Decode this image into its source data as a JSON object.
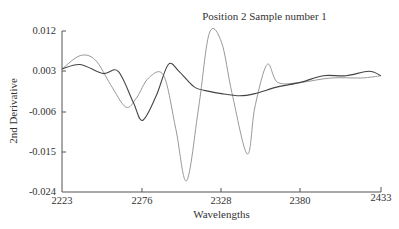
{
  "chart_data": {
    "type": "line",
    "title": "Position 2 Sample number 1",
    "xlabel": "Wavelengths",
    "ylabel": "2nd Derivative",
    "xlim": [
      2223,
      2433
    ],
    "ylim": [
      -0.024,
      0.012
    ],
    "x_ticks": [
      "2223",
      "2276",
      "2328",
      "2380",
      "2433"
    ],
    "y_ticks": [
      "0.012",
      "0.003",
      "-0.006",
      "-0.015",
      "-0.024"
    ],
    "grid": false,
    "legend": null,
    "series": [
      {
        "name": "dark",
        "color": "#444444",
        "x": [
          2223,
          2235,
          2250,
          2260,
          2270,
          2276,
          2285,
          2293,
          2300,
          2310,
          2320,
          2328,
          2340,
          2350,
          2365,
          2380,
          2395,
          2410,
          2425,
          2433
        ],
        "y": [
          0.0035,
          0.0045,
          0.0025,
          0.003,
          -0.004,
          -0.008,
          -0.0025,
          0.0045,
          0.003,
          -0.0005,
          -0.0015,
          -0.002,
          -0.0025,
          -0.002,
          -0.0005,
          0.0005,
          0.002,
          0.002,
          0.003,
          0.002
        ]
      },
      {
        "name": "light",
        "color": "#999999",
        "x": [
          2223,
          2235,
          2245,
          2255,
          2265,
          2272,
          2280,
          2290,
          2298,
          2305,
          2313,
          2320,
          2328,
          2335,
          2345,
          2350,
          2358,
          2365,
          2380,
          2400,
          2420,
          2433
        ],
        "y": [
          0.0035,
          0.0065,
          0.0055,
          0.0,
          -0.005,
          -0.003,
          0.0015,
          0.002,
          -0.01,
          -0.0215,
          -0.005,
          0.0115,
          0.0095,
          -0.002,
          -0.0155,
          -0.005,
          0.0045,
          0.0005,
          0.0005,
          0.0015,
          0.0015,
          0.002
        ]
      }
    ]
  }
}
